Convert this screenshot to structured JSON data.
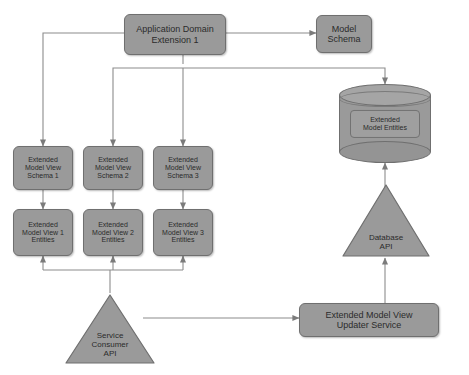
{
  "diagram": {
    "colors": {
      "node_fill": "#9a9a9a",
      "node_stroke": "#6f6f6f",
      "edge_stroke": "#8c8c8c",
      "canvas": "#ffffff",
      "text": "#2b2b2b"
    },
    "nodes": {
      "application_domain_extension": {
        "label_line1": "Application Domain",
        "label_line2": "Extension 1",
        "shape": "rounded-rect"
      },
      "model_schema": {
        "label_line1": "Model",
        "label_line2": "Schema",
        "shape": "rounded-rect"
      },
      "extended_model_entities": {
        "label_line1": "Extended",
        "label_line2": "Model Entities",
        "shape": "cylinder"
      },
      "database_api": {
        "label_line1": "Database",
        "label_line2": "API",
        "shape": "triangle"
      },
      "service_consumer_api": {
        "label_line1": "Service",
        "label_line2": "Consumer",
        "label_line3": "API",
        "shape": "triangle"
      },
      "updater_service": {
        "label_line1": "Extended Model View",
        "label_line2": "Updater Service",
        "shape": "rounded-rect"
      },
      "view_schemas": [
        {
          "line1": "Extended",
          "line2": "Model View",
          "line3": "Schema 1"
        },
        {
          "line1": "Extended",
          "line2": "Model View",
          "line3": "Schema 2"
        },
        {
          "line1": "Extended",
          "line2": "Model View",
          "line3": "Schema 3"
        }
      ],
      "view_entities": [
        {
          "line1": "Extended",
          "line2": "Model View 1",
          "line3": "Entities"
        },
        {
          "line1": "Extended",
          "line2": "Model View 2",
          "line3": "Entities"
        },
        {
          "line1": "Extended",
          "line2": "Model View 3",
          "line3": "Entities"
        }
      ]
    }
  }
}
